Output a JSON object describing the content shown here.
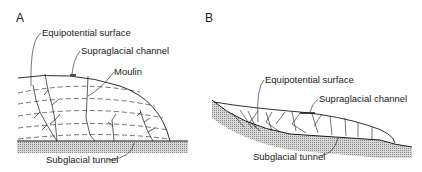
{
  "figure": {
    "panel_a": {
      "label": "A",
      "labels": {
        "equipotential": "Equipotential surface",
        "supraglacial": "Supraglacial channel",
        "moulin": "Moulin",
        "subglacial": "Subglacial tunnel"
      }
    },
    "panel_b": {
      "label": "B",
      "labels": {
        "equipotential": "Equipotential surface",
        "supraglacial": "Supraglacial channel",
        "subglacial": "Subglacial tunnel"
      }
    },
    "colors": {
      "ink": "#1a1a1a",
      "bed_hatch": "#9a9a9a",
      "background": "#ffffff"
    }
  }
}
